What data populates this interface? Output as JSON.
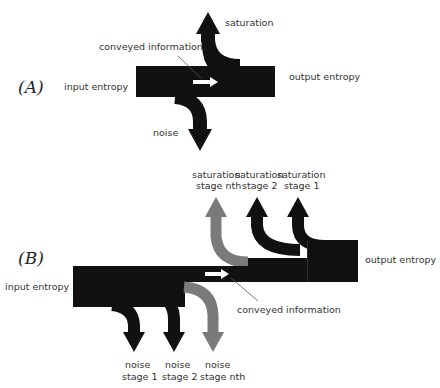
{
  "colors": {
    "flow": "#111111",
    "flow_nth": "#7a7a7a",
    "arrow_conveyed": "#ffffff",
    "pointer": "#555555",
    "text": "#333333"
  },
  "panel_a": {
    "label": "(A)",
    "input": "input entropy",
    "output": "output entropy",
    "conveyed": "conveyed information",
    "saturation": "saturation",
    "noise": "noise"
  },
  "panel_b": {
    "label": "(B)",
    "input": "input entropy",
    "output": "output entropy",
    "conveyed": "conveyed information",
    "saturation": [
      {
        "line1": "saturation",
        "line2": "stage nth"
      },
      {
        "line1": "saturation",
        "line2": "stage 2"
      },
      {
        "line1": "saturation",
        "line2": "stage 1"
      }
    ],
    "noise": [
      {
        "line1": "noise",
        "line2": "stage 1"
      },
      {
        "line1": "noise",
        "line2": "stage 2"
      },
      {
        "line1": "noise",
        "line2": "stage nth"
      }
    ]
  }
}
